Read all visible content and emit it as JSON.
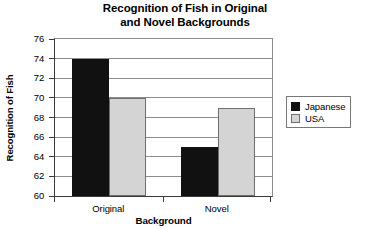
{
  "chart_data": {
    "type": "bar",
    "title": "Recognition of Fish in Original and Novel Backgrounds",
    "title_lines": [
      "Recognition of Fish in Original",
      "and Novel Backgrounds"
    ],
    "xlabel": "Background",
    "ylabel": "Recognition of Fish",
    "categories": [
      "Original",
      "Novel"
    ],
    "series": [
      {
        "name": "Japanese",
        "values": [
          74,
          65
        ],
        "color": "#111111"
      },
      {
        "name": "USA",
        "values": [
          70,
          69
        ],
        "color": "#d4d4d4"
      }
    ],
    "ylim": [
      60,
      76
    ],
    "ytick_step": 2,
    "yticks": [
      76,
      74,
      72,
      70,
      68,
      66,
      64,
      62,
      60
    ],
    "ytick_labels": [
      "76",
      "74",
      "72",
      "70",
      "68",
      "66",
      "64",
      "62",
      "60"
    ],
    "grid": true,
    "grid_axis": "y",
    "legend_position": "right",
    "legend_entries": [
      "Japanese",
      "USA"
    ]
  }
}
